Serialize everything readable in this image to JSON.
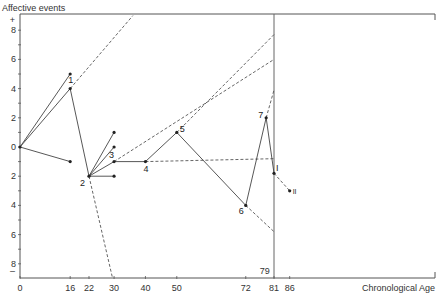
{
  "chart_data": {
    "type": "line",
    "title": "",
    "ylabel": "Affective events",
    "xlabel": "Chronological Age",
    "xlim": [
      0,
      132
    ],
    "ylim": [
      -9,
      9
    ],
    "grid": false,
    "x_ticks": [
      0,
      16,
      22,
      30,
      40,
      50,
      72,
      81,
      86
    ],
    "x_marker_label": "79",
    "y_ticks": [
      {
        "value": 8,
        "label": "8"
      },
      {
        "value": 6,
        "label": "6"
      },
      {
        "value": 4,
        "label": "4"
      },
      {
        "value": 2,
        "label": "2"
      },
      {
        "value": 0,
        "label": "0"
      },
      {
        "value": -2,
        "label": "2"
      },
      {
        "value": -4,
        "label": "4"
      },
      {
        "value": -6,
        "label": "6"
      },
      {
        "value": -8,
        "label": "8"
      }
    ],
    "y_plus_label": "+",
    "y_minus_label": "–",
    "reference_line_age": 81,
    "main_path": [
      {
        "x": 0,
        "y": 0
      },
      {
        "x": 16,
        "y": 4,
        "label": "1"
      },
      {
        "x": 22,
        "y": -2,
        "label": "2"
      },
      {
        "x": 30,
        "y": -1,
        "label": "3"
      },
      {
        "x": 40,
        "y": -1,
        "label": "4"
      },
      {
        "x": 50,
        "y": 1,
        "label": "5"
      },
      {
        "x": 72,
        "y": -4,
        "label": "6"
      },
      {
        "x": 78.5,
        "y": 2,
        "label": "7"
      },
      {
        "x": 81,
        "y": -1.8,
        "label": "I"
      }
    ],
    "branches": [
      {
        "from": {
          "x": 0,
          "y": 0
        },
        "to": {
          "x": 16,
          "y": 5
        }
      },
      {
        "from": {
          "x": 0,
          "y": 0
        },
        "to": {
          "x": 16,
          "y": -1
        }
      },
      {
        "from": {
          "x": 22,
          "y": -2
        },
        "to": {
          "x": 30,
          "y": 1
        }
      },
      {
        "from": {
          "x": 22,
          "y": -2
        },
        "to": {
          "x": 30,
          "y": 0
        }
      },
      {
        "from": {
          "x": 22,
          "y": -2
        },
        "to": {
          "x": 30,
          "y": -2
        }
      }
    ],
    "projections": [
      {
        "from": {
          "x": 16,
          "y": 4
        },
        "to": {
          "x": 36,
          "y": 9
        }
      },
      {
        "from": {
          "x": 22,
          "y": -2
        },
        "to": {
          "x": 29.5,
          "y": -9.6
        }
      },
      {
        "from": {
          "x": 30,
          "y": -1
        },
        "to": {
          "x": 81,
          "y": 6
        }
      },
      {
        "from": {
          "x": 40,
          "y": -1
        },
        "to": {
          "x": 81,
          "y": -0.8
        }
      },
      {
        "from": {
          "x": 50,
          "y": 1
        },
        "to": {
          "x": 81,
          "y": 7.7
        }
      },
      {
        "from": {
          "x": 72,
          "y": -4
        },
        "to": {
          "x": 81,
          "y": -5.8
        }
      },
      {
        "from": {
          "x": 78.5,
          "y": 2
        },
        "to": {
          "x": 81,
          "y": 3.9
        }
      },
      {
        "from": {
          "x": 81,
          "y": -1.8
        },
        "to": {
          "x": 86,
          "y": -3
        },
        "label": "II"
      }
    ]
  }
}
